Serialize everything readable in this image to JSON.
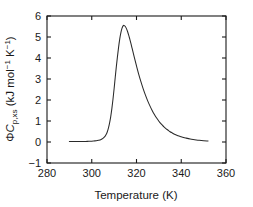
{
  "figure": {
    "background_color": "#ffffff",
    "axis_color": "#1a1a1a",
    "curve_color": "#2a2a2a"
  },
  "axes": {
    "xlabel": "Temperature (K)",
    "ylabel_parts": {
      "phi": "Φ",
      "c": "C",
      "subscript": "p,xs",
      "units_open": " (kJ mol",
      "units_sup1": "−1",
      "units_mid": " K",
      "units_sup2": "−1",
      "units_close": ")"
    },
    "ylabel_plain": "ΦCp,xs (kJ mol−1 K−1)",
    "x_ticks": [
      "280",
      "300",
      "320",
      "340",
      "360"
    ],
    "y_ticks": [
      "6",
      "5",
      "4",
      "3",
      "2",
      "1",
      "0",
      "−1"
    ]
  },
  "chart_data": {
    "type": "line",
    "title": "",
    "subtitle": "",
    "xlabel": "Temperature (K)",
    "ylabel": "ΦCp,xs (kJ mol−1 K−1)",
    "xlim": [
      280,
      360
    ],
    "ylim": [
      -1,
      6
    ],
    "xticks": [
      280,
      300,
      320,
      340,
      360
    ],
    "yticks": [
      -1,
      0,
      1,
      2,
      3,
      4,
      5,
      6
    ],
    "grid": false,
    "legend": null,
    "annotations": [],
    "peak": {
      "x": 314.5,
      "y": 5.55,
      "label": ""
    },
    "series": [
      {
        "name": "excess heat capacity",
        "x": [
          290.0,
          292.0,
          294.0,
          296.0,
          298.0,
          300.0,
          301.0,
          302.0,
          303.0,
          304.0,
          305.0,
          306.0,
          306.5,
          307.0,
          307.5,
          308.0,
          308.5,
          309.0,
          309.5,
          310.0,
          310.5,
          311.0,
          311.5,
          312.0,
          312.5,
          313.0,
          313.5,
          314.0,
          314.5,
          315.0,
          315.5,
          316.0,
          316.5,
          317.0,
          317.5,
          318.0,
          319.0,
          320.0,
          321.0,
          322.0,
          323.0,
          324.0,
          325.0,
          326.0,
          327.0,
          328.0,
          329.0,
          330.0,
          331.0,
          332.0,
          333.0,
          334.0,
          335.0,
          336.0,
          337.0,
          338.0,
          339.0,
          340.0,
          342.0,
          344.0,
          346.0,
          348.0,
          350.0,
          352.0
        ],
        "y": [
          0.02,
          0.02,
          0.02,
          0.02,
          0.03,
          0.04,
          0.05,
          0.06,
          0.08,
          0.11,
          0.17,
          0.28,
          0.37,
          0.5,
          0.68,
          0.92,
          1.22,
          1.6,
          2.05,
          2.55,
          3.08,
          3.6,
          4.08,
          4.52,
          4.9,
          5.2,
          5.41,
          5.53,
          5.55,
          5.5,
          5.4,
          5.26,
          5.09,
          4.9,
          4.7,
          4.48,
          4.04,
          3.62,
          3.22,
          2.86,
          2.53,
          2.23,
          1.96,
          1.72,
          1.5,
          1.31,
          1.14,
          0.99,
          0.86,
          0.75,
          0.65,
          0.57,
          0.49,
          0.43,
          0.37,
          0.32,
          0.28,
          0.25,
          0.19,
          0.14,
          0.11,
          0.08,
          0.06,
          0.05
        ]
      }
    ]
  }
}
